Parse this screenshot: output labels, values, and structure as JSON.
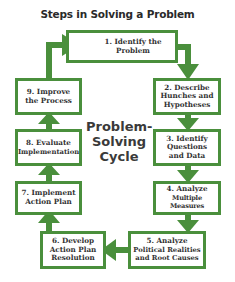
{
  "title": "Steps in Solving a Problem",
  "center_label": [
    "Problem-",
    "Solving",
    "Cycle"
  ],
  "colors": {
    "accent": "#4a8f3c",
    "text": "#333333",
    "background": "#ffffff"
  },
  "steps": [
    {
      "number": "1.",
      "lines": [
        "1.  Identify the",
        "Problem"
      ]
    },
    {
      "number": "2.",
      "lines": [
        "2.  Describe",
        "Hunches and",
        "Hypotheses"
      ]
    },
    {
      "number": "3.",
      "lines": [
        "3.  Identify",
        "Questions",
        "and Data"
      ]
    },
    {
      "number": "4.",
      "lines": [
        "4.  Analyze",
        "Multiple Measures"
      ]
    },
    {
      "number": "5.",
      "lines": [
        "5.  Analyze",
        "Political Realities",
        "and Root Causes"
      ]
    },
    {
      "number": "6.",
      "lines": [
        "6.  Develop",
        "Action Plan",
        "Resolution"
      ]
    },
    {
      "number": "7.",
      "lines": [
        "7.  Implement",
        "Action Plan"
      ]
    },
    {
      "number": "8.",
      "lines": [
        "8.  Evaluate",
        "Implementation"
      ]
    },
    {
      "number": "9.",
      "lines": [
        "9.  Improve",
        "the Process"
      ]
    }
  ]
}
